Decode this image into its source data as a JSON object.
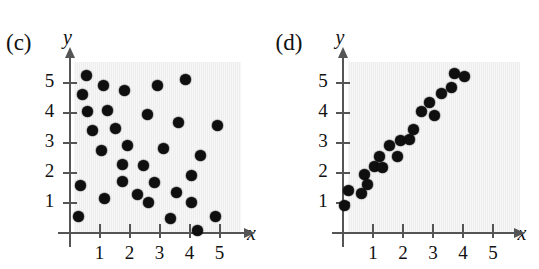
{
  "figure": {
    "panels": [
      {
        "key": "c",
        "label": "(c)",
        "x_axis_label": "x",
        "y_axis_label": "y"
      },
      {
        "key": "d",
        "label": "(d)",
        "x_axis_label": "x",
        "y_axis_label": "y"
      }
    ],
    "x_ticks": [
      "1",
      "2",
      "3",
      "4",
      "5"
    ],
    "y_ticks": [
      "1",
      "2",
      "3",
      "4",
      "5"
    ],
    "dot_color": "#100f0f",
    "plot_background": "#eeeeee",
    "axis_color": "#555555"
  },
  "chart_data": [
    {
      "type": "scatter",
      "title": "(c)",
      "xlabel": "x",
      "ylabel": "y",
      "xlim": [
        0,
        5.8
      ],
      "ylim": [
        0,
        5.8
      ],
      "xticks": [
        1,
        2,
        3,
        4,
        5
      ],
      "yticks": [
        1,
        2,
        3,
        4,
        5
      ],
      "grid": false,
      "legend": "none",
      "description": "No correlation / random scatter",
      "points": [
        [
          0.55,
          5.25
        ],
        [
          0.44,
          4.62
        ],
        [
          1.12,
          4.92
        ],
        [
          1.82,
          4.75
        ],
        [
          2.92,
          4.93
        ],
        [
          3.85,
          5.12
        ],
        [
          0.6,
          4.05
        ],
        [
          1.27,
          4.08
        ],
        [
          2.6,
          3.95
        ],
        [
          3.62,
          3.68
        ],
        [
          4.92,
          3.6
        ],
        [
          0.78,
          3.42
        ],
        [
          1.52,
          3.48
        ],
        [
          1.93,
          2.93
        ],
        [
          3.12,
          2.83
        ],
        [
          1.06,
          2.75
        ],
        [
          4.35,
          2.58
        ],
        [
          1.75,
          2.3
        ],
        [
          2.48,
          2.25
        ],
        [
          4.08,
          1.93
        ],
        [
          0.35,
          1.6
        ],
        [
          1.75,
          1.72
        ],
        [
          2.82,
          1.7
        ],
        [
          3.55,
          1.35
        ],
        [
          2.28,
          1.28
        ],
        [
          1.18,
          1.15
        ],
        [
          2.62,
          1.02
        ],
        [
          4.05,
          1.02
        ],
        [
          0.3,
          0.55
        ],
        [
          3.38,
          0.48
        ],
        [
          4.88,
          0.55
        ],
        [
          4.25,
          0.08
        ]
      ]
    },
    {
      "type": "scatter",
      "title": "(d)",
      "xlabel": "x",
      "ylabel": "y",
      "xlim": [
        0,
        5.8
      ],
      "ylim": [
        0,
        5.8
      ],
      "xticks": [
        1,
        2,
        3,
        4,
        5
      ],
      "yticks": [
        1,
        2,
        3,
        4,
        5
      ],
      "grid": false,
      "legend": "none",
      "description": "Strong positive linear correlation",
      "points": [
        [
          0.05,
          0.92
        ],
        [
          0.18,
          1.42
        ],
        [
          0.6,
          1.32
        ],
        [
          0.72,
          1.95
        ],
        [
          0.82,
          1.63
        ],
        [
          1.05,
          2.22
        ],
        [
          1.22,
          2.55
        ],
        [
          1.32,
          2.18
        ],
        [
          1.55,
          2.92
        ],
        [
          1.82,
          2.55
        ],
        [
          1.92,
          3.08
        ],
        [
          2.22,
          3.12
        ],
        [
          2.35,
          3.45
        ],
        [
          2.62,
          4.05
        ],
        [
          2.88,
          4.35
        ],
        [
          3.05,
          3.92
        ],
        [
          3.28,
          4.65
        ],
        [
          3.62,
          4.85
        ],
        [
          3.72,
          5.32
        ],
        [
          4.05,
          5.22
        ]
      ]
    }
  ]
}
